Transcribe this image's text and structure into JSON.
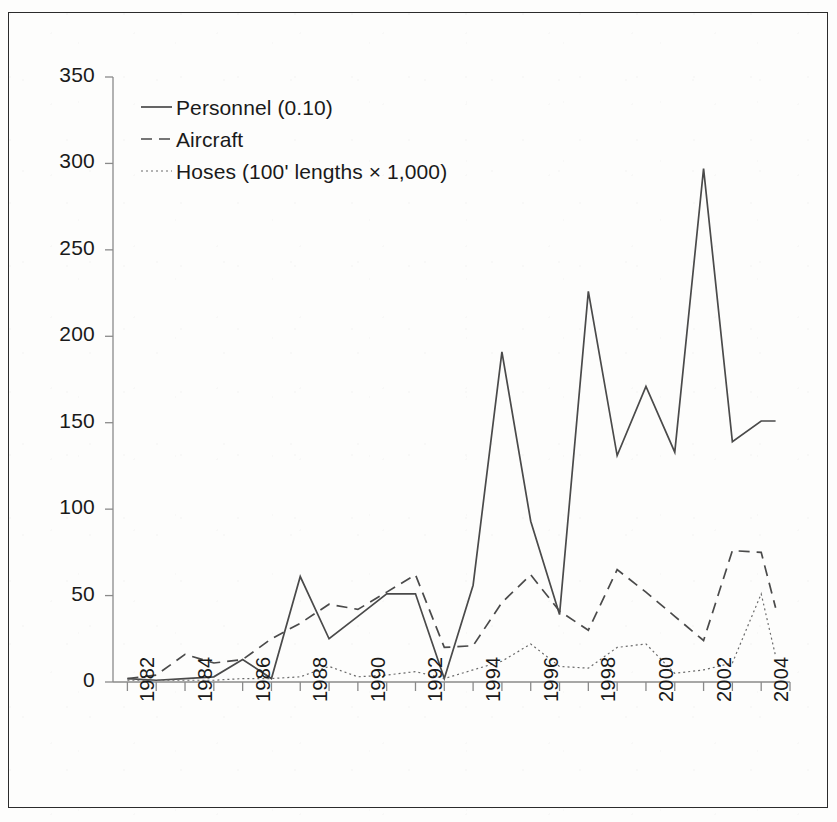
{
  "chart_data": {
    "type": "line",
    "title": "",
    "subtitle": "",
    "xlabel": "",
    "ylabel": "",
    "xlim": [
      1981.5,
      2005.0
    ],
    "ylim": [
      0,
      350
    ],
    "yticks": [
      0,
      50,
      100,
      150,
      200,
      250,
      300,
      350
    ],
    "ytick_labels": [
      "0",
      "50",
      "100",
      "150",
      "200",
      "250",
      "300",
      "350"
    ],
    "xticks": [
      1982,
      1983,
      1984,
      1985,
      1986,
      1987,
      1988,
      1989,
      1990,
      1991,
      1992,
      1993,
      1994,
      1995,
      1996,
      1997,
      1998,
      1999,
      2000,
      2001,
      2002,
      2003,
      2004
    ],
    "xtick_labels": [
      "1982",
      "",
      "1984",
      "",
      "1986",
      "",
      "1988",
      "",
      "1990",
      "",
      "1992",
      "",
      "1994",
      "",
      "1996",
      "",
      "1998",
      "",
      "2000",
      "",
      "2002",
      "",
      "2004"
    ],
    "x_labeled_years": [
      "1982",
      "1984",
      "1986",
      "1988",
      "1990",
      "1992",
      "1994",
      "1996",
      "1998",
      "2000",
      "2002",
      "2004"
    ],
    "grid": false,
    "legend_position": "top-left",
    "x": [
      1982,
      1983,
      1984,
      1985,
      1986,
      1987,
      1988,
      1989,
      1990,
      1991,
      1992,
      1993,
      1994,
      1995,
      1996,
      1997,
      1998,
      1999,
      2000,
      2001,
      2002,
      2003,
      2004
    ],
    "series": [
      {
        "name": "Personnel (0.10)",
        "style": "solid",
        "color": "#4a4a4a",
        "values": [
          2,
          1,
          2,
          3,
          13,
          2,
          61,
          25,
          38,
          51,
          51,
          2,
          56,
          191,
          93,
          39,
          226,
          131,
          171,
          133,
          297,
          139,
          151
        ]
      },
      {
        "name": "Aircraft",
        "style": "dashed",
        "color": "#4a4a4a",
        "values": [
          2,
          4,
          16,
          11,
          13,
          25,
          34,
          45,
          42,
          52,
          62,
          20,
          21,
          46,
          62,
          41,
          30,
          65,
          52,
          38,
          24,
          76,
          75
        ]
      },
      {
        "name": "Hoses (100' lengths × 1,000)",
        "style": "dotted",
        "color": "#6a6a6a",
        "values": [
          1,
          1,
          1,
          1,
          2,
          2,
          3,
          9,
          3,
          4,
          6,
          2,
          7,
          12,
          22,
          9,
          8,
          20,
          22,
          5,
          7,
          11,
          51
        ]
      }
    ],
    "series_endpoints": {
      "personnel_last_x": 2004.5,
      "aircraft_last_value": 43,
      "hoses_last_value": 15
    }
  },
  "legend": {
    "items": [
      {
        "label": "Personnel (0.10)",
        "style": "solid"
      },
      {
        "label": "Aircraft",
        "style": "dashed"
      },
      {
        "label": "Hoses (100' lengths × 1,000)",
        "style": "dotted"
      }
    ]
  },
  "axis": {
    "y_tick_labels": [
      "350",
      "300",
      "250",
      "200",
      "150",
      "100",
      "50",
      "0"
    ],
    "x_tick_labels": [
      "1982",
      "1984",
      "1986",
      "1988",
      "1990",
      "1992",
      "1994",
      "1996",
      "1998",
      "2000",
      "2002",
      "2004"
    ]
  },
  "colors": {
    "ink": "#1a1a1a",
    "line": "#4a4a4a",
    "thin_line": "#6a6a6a",
    "background": "#fdfdfc",
    "border": "#2b2b2b"
  }
}
